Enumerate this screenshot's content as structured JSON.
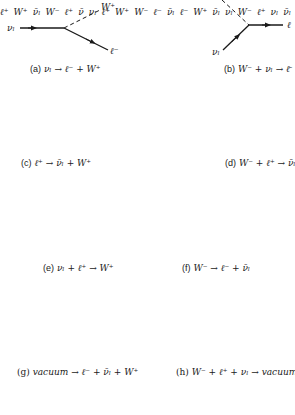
{
  "figure": {
    "panels": [
      {
        "id": "a",
        "tag": "(a)",
        "equation": "νₗ → ℓ⁻ + W⁺",
        "labels": [
          "νₗ",
          "W⁺",
          "ℓ⁻"
        ]
      },
      {
        "id": "b",
        "tag": "(b)",
        "equation": "W⁻ + νₗ → ℓ̄",
        "labels": [
          "W⁻",
          "νₗ",
          "ℓ"
        ]
      },
      {
        "id": "c",
        "tag": "(c)",
        "equation": "ℓ⁺ → ν̄ₗ + W⁺",
        "labels": [
          "ℓ⁺",
          "W⁺",
          "ν̄ₗ"
        ]
      },
      {
        "id": "d",
        "tag": "(d)",
        "equation": "W⁻ + ℓ⁺ → ν̄ₗ",
        "labels": [
          "W⁻",
          "ℓ⁺",
          "ν̄"
        ]
      },
      {
        "id": "e",
        "tag": "(e)",
        "equation": "νₗ + ℓ⁺ → W⁺",
        "labels": [
          "νₗ",
          "ℓ⁺",
          "W⁺"
        ]
      },
      {
        "id": "f",
        "tag": "(f)",
        "equation": "W⁻ → ℓ⁻ + ν̄ₗ",
        "labels": [
          "W⁻",
          "ℓ⁻",
          "ν̄ₗ"
        ]
      },
      {
        "id": "g",
        "tag": "(g)",
        "equation": "vacuum → ℓ⁻ + ν̄ₗ + W⁺",
        "labels": [
          "ℓ⁻",
          "W⁺",
          "ν̄ₗ"
        ]
      },
      {
        "id": "h",
        "tag": "(h)",
        "equation": "W⁻ + ℓ⁺ + νₗ → vacuum",
        "labels": [
          "νₗ",
          "W⁻",
          "ℓ⁺"
        ]
      }
    ],
    "partial_labels": [
      "νₗ",
      "ν̄ₗ"
    ],
    "colors": {
      "line": "#1a1a1a",
      "background": "#ffffff"
    }
  }
}
